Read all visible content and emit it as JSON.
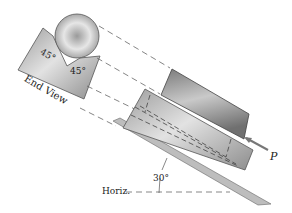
{
  "figure": {
    "labels": {
      "end_view": "End View",
      "angle_left": "45°",
      "angle_right": "45°",
      "incline_angle": "30°",
      "horizontal": "Horiz.",
      "force": "P"
    },
    "colors": {
      "metal_light": "#d8d8d8",
      "metal_mid": "#a9a9a9",
      "metal_dark": "#6f6f6f",
      "dash": "#555555",
      "arrow": "#777777"
    }
  }
}
